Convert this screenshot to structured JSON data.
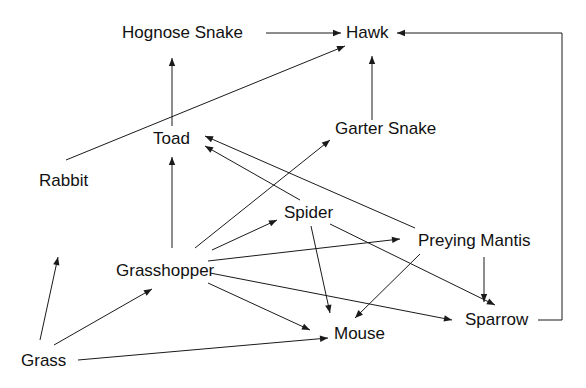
{
  "diagram": {
    "title": "",
    "type": "food-web",
    "nodes": [
      {
        "id": "hognose",
        "label": "Hognose Snake",
        "x": 122,
        "y": 24
      },
      {
        "id": "hawk",
        "label": "Hawk",
        "x": 346,
        "y": 24
      },
      {
        "id": "toad",
        "label": "Toad",
        "x": 153,
        "y": 130
      },
      {
        "id": "garter",
        "label": "Garter Snake",
        "x": 335,
        "y": 120
      },
      {
        "id": "rabbit",
        "label": "Rabbit",
        "x": 39,
        "y": 172
      },
      {
        "id": "spider",
        "label": "Spider",
        "x": 284,
        "y": 204
      },
      {
        "id": "mantis",
        "label": "Preying Mantis",
        "x": 418,
        "y": 232
      },
      {
        "id": "grasshopper",
        "label": "Grasshopper",
        "x": 116,
        "y": 262
      },
      {
        "id": "sparrow",
        "label": "Sparrow",
        "x": 465,
        "y": 311
      },
      {
        "id": "mouse",
        "label": "Mouse",
        "x": 334,
        "y": 325
      },
      {
        "id": "grass",
        "label": "Grass",
        "x": 21,
        "y": 352
      }
    ],
    "edges": [
      {
        "from": "hognose",
        "to": "hawk",
        "path": "M266,33 L341,33"
      },
      {
        "from": "sparrow",
        "to": "hawk",
        "path": "M538,320 L562,320 L562,33 L397,33"
      },
      {
        "from": "rabbit",
        "to": "hawk",
        "path": "M66,160 L345,46"
      },
      {
        "from": "garter",
        "to": "hawk",
        "path": "M372,120 L372,56"
      },
      {
        "from": "toad",
        "to": "hognose",
        "path": "M172,126 L172,58"
      },
      {
        "from": "grasshopper",
        "to": "toad",
        "path": "M172,248 L172,157"
      },
      {
        "from": "grasshopper",
        "to": "garter",
        "path": "M195,248 L330,140"
      },
      {
        "from": "spider",
        "to": "toad",
        "path": "M300,200 L205,146"
      },
      {
        "from": "mantis",
        "to": "toad",
        "path": "M415,228 L205,136"
      },
      {
        "from": "grasshopper",
        "to": "spider",
        "path": "M212,250 L277,220"
      },
      {
        "from": "grasshopper",
        "to": "mantis",
        "path": "M208,261 L400,239"
      },
      {
        "from": "grasshopper",
        "to": "mouse",
        "path": "M208,283 L310,330"
      },
      {
        "from": "grasshopper",
        "to": "sparrow",
        "path": "M210,273 L452,320"
      },
      {
        "from": "spider",
        "to": "mouse",
        "path": "M311,226 L330,313"
      },
      {
        "from": "spider",
        "to": "sparrow",
        "path": "M330,224 L495,305"
      },
      {
        "from": "mantis",
        "to": "mouse",
        "path": "M420,254 L355,318"
      },
      {
        "from": "mantis",
        "to": "sparrow",
        "path": "M484,257 L484,302"
      },
      {
        "from": "grass",
        "to": "rabbit",
        "path": "M40,340 L58,257"
      },
      {
        "from": "grass",
        "to": "grasshopper",
        "path": "M54,345 L152,289"
      },
      {
        "from": "grass",
        "to": "mouse",
        "path": "M78,360 L328,338"
      }
    ]
  },
  "colors": {
    "line": "#1a1a1a",
    "text": "#111111",
    "background": "#ffffff"
  }
}
